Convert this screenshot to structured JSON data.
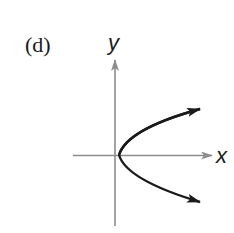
{
  "figure": {
    "panel_label": "(d)",
    "x_axis_label": "x",
    "y_axis_label": "y"
  },
  "colors": {
    "axis": "#8c8c8c",
    "curve": "#1a1a1a",
    "text": "#1a1a1a"
  }
}
